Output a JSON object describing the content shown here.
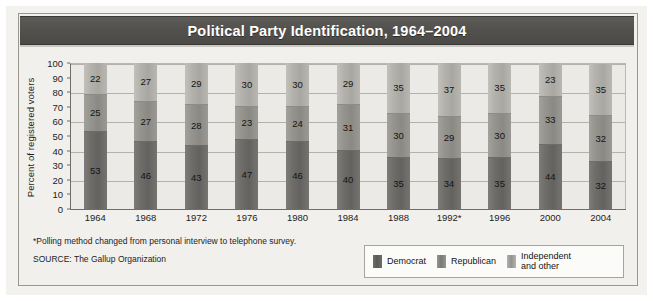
{
  "title": "Political Party Identification, 1964–2004",
  "footnote": "*Polling method changed from personal interview to telephone survey.",
  "source": "SOURCE: The Gallup Organization",
  "legend": {
    "items": [
      {
        "label": "Democrat",
        "color": "#6f6d69"
      },
      {
        "label": "Republican",
        "color": "#96948f"
      },
      {
        "label_line1": "Independent",
        "label_line2": "and other",
        "color": "#b4b2ad"
      }
    ]
  },
  "chart_data": {
    "type": "bar",
    "stacked": true,
    "title": "Political Party Identification, 1964–2004",
    "xlabel": "",
    "ylabel": "Percent of registered voters",
    "ylim": [
      0,
      100
    ],
    "ytick_labels": [
      "100",
      "90",
      "80",
      "70",
      "60",
      "50",
      "40",
      "30",
      "20",
      "10",
      "0"
    ],
    "ytick_values": [
      100,
      90,
      80,
      70,
      60,
      50,
      40,
      30,
      20,
      10,
      0
    ],
    "gridlines_at": [
      20,
      40,
      60,
      80,
      100
    ],
    "grid": true,
    "legend_position": "bottom-right",
    "categories": [
      "1964",
      "1968",
      "1972",
      "1976",
      "1980",
      "1984",
      "1988",
      "1992*",
      "1996",
      "2000",
      "2004"
    ],
    "series": [
      {
        "name": "Democrat",
        "color": "#6f6d69",
        "values": [
          53,
          46,
          43,
          47,
          46,
          40,
          35,
          34,
          35,
          44,
          32
        ]
      },
      {
        "name": "Republican",
        "color": "#96948f",
        "values": [
          25,
          27,
          28,
          23,
          24,
          31,
          30,
          29,
          30,
          33,
          32
        ]
      },
      {
        "name": "Independent and other",
        "color": "#b4b2ad",
        "values": [
          22,
          27,
          29,
          30,
          30,
          29,
          35,
          37,
          35,
          23,
          35
        ]
      }
    ]
  }
}
